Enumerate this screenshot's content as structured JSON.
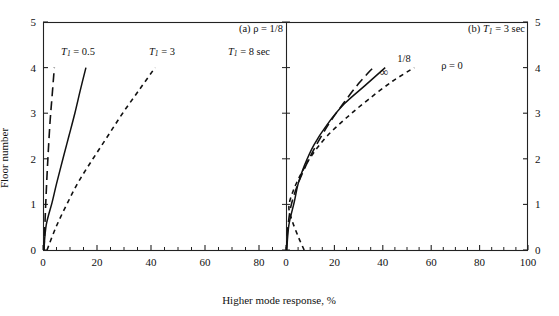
{
  "figure": {
    "xlabel": "Higher mode response, %",
    "ylabel": "Floor number"
  },
  "panels": [
    {
      "id": "a",
      "title_plain": "(a) ρ = 1/8",
      "title_prefix": "(a) ρ = 1/8",
      "xticks": [
        "0",
        "20",
        "40",
        "60",
        "80"
      ],
      "yticks": [
        "0",
        "1",
        "2",
        "3",
        "4",
        "5"
      ],
      "curve_labels": [
        {
          "text": "T₁ = 0.5",
          "x": 78,
          "y": 52
        },
        {
          "text": "T₁ = 3",
          "x": 160,
          "y": 52
        },
        {
          "text": "T₁ = 8 sec",
          "x": 247,
          "y": 52
        }
      ]
    },
    {
      "id": "b",
      "title_plain": "(b) T₁ = 3 sec",
      "xticks": [
        "0",
        "20",
        "40",
        "60",
        "80",
        "100"
      ],
      "yticks": [
        "0",
        "1",
        "2",
        "3",
        "4",
        "5"
      ],
      "curve_labels": [
        {
          "text": "∞",
          "x": 384,
          "y": 71
        },
        {
          "text": "1/8",
          "x": 403,
          "y": 57
        },
        {
          "text": "ρ = 0",
          "x": 450,
          "y": 64
        }
      ]
    }
  ],
  "chart_data": {
    "type": "line",
    "title": "",
    "xlabel": "Higher mode response, %",
    "ylabel": "Floor number",
    "grid": false,
    "legend": "inline-labels",
    "panels": [
      {
        "id": "a",
        "panel_title": "(a) ρ = 1/8",
        "xlim": [
          0,
          90
        ],
        "ylim": [
          0,
          5
        ],
        "xticks": [
          0,
          20,
          40,
          60,
          80
        ],
        "yticks": [
          0,
          1,
          2,
          3,
          4,
          5
        ],
        "series": [
          {
            "name": "T1 = 0.5",
            "style": "long-dash",
            "x": [
              0.4,
              0.8,
              1.3,
              1.9,
              2.6,
              3.4,
              4.2
            ],
            "y": [
              0.0,
              0.7,
              1.4,
              2.1,
              2.8,
              3.4,
              4.0
            ]
          },
          {
            "name": "T1 = 3",
            "style": "solid",
            "x": [
              0.3,
              1.2,
              3.4,
              5.0,
              7.6,
              9.6,
              11.8,
              13.8,
              15.9
            ],
            "y": [
              0.0,
              0.55,
              1.05,
              1.45,
              2.05,
              2.5,
              3.0,
              3.5,
              4.0
            ]
          },
          {
            "name": "T1 = 8 sec",
            "style": "short-dash",
            "x": [
              1.5,
              4.8,
              8.8,
              13.2,
              18.5,
              24.0,
              29.5,
              35.5,
              41.5
            ],
            "y": [
              0.0,
              0.5,
              1.0,
              1.5,
              2.0,
              2.5,
              3.0,
              3.5,
              4.0
            ]
          }
        ]
      },
      {
        "id": "b",
        "panel_title": "(b) T1 = 3 sec",
        "xlim": [
          0,
          100
        ],
        "ylim": [
          0,
          5
        ],
        "xticks": [
          0,
          20,
          40,
          60,
          80,
          100
        ],
        "yticks": [
          0,
          1,
          2,
          3,
          4,
          5
        ],
        "series": [
          {
            "name": "infinity",
            "style": "long-dash",
            "x": [
              0.2,
              0.7,
              2.0,
              4.6,
              8.2,
              12.0,
              17.5,
              23.5,
              30.0,
              36.0
            ],
            "y": [
              0.0,
              0.45,
              0.95,
              1.4,
              1.85,
              2.25,
              2.75,
              3.2,
              3.65,
              4.0
            ]
          },
          {
            "name": "1/8",
            "style": "solid",
            "x": [
              0.3,
              1.2,
              3.4,
              5.0,
              7.6,
              11.5,
              17.0,
              24.0,
              32.5,
              41.0
            ],
            "y": [
              0.0,
              0.55,
              1.05,
              1.45,
              1.85,
              2.3,
              2.75,
              3.2,
              3.6,
              4.0
            ]
          },
          {
            "name": "ρ = 0",
            "style": "short-dash",
            "x": [
              7.5,
              5.0,
              2.5,
              1.2,
              3.0,
              6.5,
              11.0,
              17.0,
              25.0,
              34.0,
              44.0,
              53.0
            ],
            "y": [
              0.0,
              0.3,
              0.65,
              0.95,
              1.3,
              1.7,
              2.1,
              2.5,
              2.9,
              3.3,
              3.7,
              4.0
            ]
          }
        ]
      }
    ]
  }
}
